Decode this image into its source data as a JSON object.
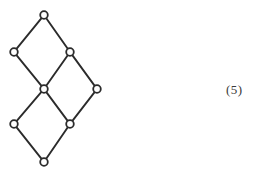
{
  "figure": {
    "label": "(5)",
    "caption_position": "right",
    "background_color": "#ffffff",
    "stroke_color": "#2b2b2b",
    "node_fill_color": "#ffffff",
    "node_radius": 3.8,
    "edge_width": 1.9,
    "width": 261,
    "height": 176
  },
  "chart_data": {
    "type": "diagram",
    "subtype": "hasse-lattice-graph",
    "title": "",
    "xlabel": "",
    "ylabel": "",
    "grid": false,
    "legend": null,
    "node_count": 8,
    "edge_count": 10,
    "nodes": [
      {
        "id": "n1",
        "label": "",
        "x": 44,
        "y": 15,
        "rank": 0,
        "role": "top"
      },
      {
        "id": "n2",
        "label": "",
        "x": 14,
        "y": 52,
        "rank": 1,
        "role": "upper-left"
      },
      {
        "id": "n3",
        "label": "",
        "x": 70,
        "y": 52,
        "rank": 1,
        "role": "upper-right"
      },
      {
        "id": "n4",
        "label": "",
        "x": 44,
        "y": 89,
        "rank": 2,
        "role": "center"
      },
      {
        "id": "n5",
        "label": "",
        "x": 97,
        "y": 89,
        "rank": 2,
        "role": "right"
      },
      {
        "id": "n6",
        "label": "",
        "x": 14,
        "y": 124,
        "rank": 3,
        "role": "lower-left"
      },
      {
        "id": "n7",
        "label": "",
        "x": 70,
        "y": 124,
        "rank": 3,
        "role": "lower-right"
      },
      {
        "id": "n8",
        "label": "",
        "x": 44,
        "y": 162,
        "rank": 4,
        "role": "bottom"
      }
    ],
    "edges": [
      {
        "from": "n1",
        "to": "n2"
      },
      {
        "from": "n1",
        "to": "n3"
      },
      {
        "from": "n2",
        "to": "n4"
      },
      {
        "from": "n3",
        "to": "n4"
      },
      {
        "from": "n3",
        "to": "n5"
      },
      {
        "from": "n4",
        "to": "n6"
      },
      {
        "from": "n4",
        "to": "n7"
      },
      {
        "from": "n5",
        "to": "n7"
      },
      {
        "from": "n6",
        "to": "n8"
      },
      {
        "from": "n7",
        "to": "n8"
      }
    ],
    "annotations": [
      {
        "text": "(5)",
        "x": 238,
        "y": 90
      }
    ]
  }
}
